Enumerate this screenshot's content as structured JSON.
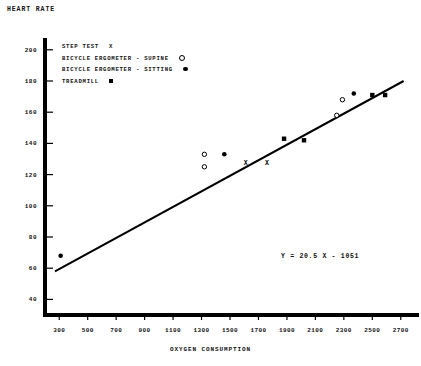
{
  "chart_data": {
    "type": "scatter",
    "title": "HEART RATE",
    "ylabel": "HEART RATE",
    "xlabel": "OXYGEN CONSUMPTION",
    "xlim": [
      200,
      2800
    ],
    "ylim": [
      30,
      205
    ],
    "xticks": [
      300,
      500,
      700,
      900,
      1100,
      1300,
      1500,
      1700,
      1900,
      2100,
      2300,
      2500,
      2700
    ],
    "yticks": [
      40,
      60,
      80,
      100,
      120,
      140,
      160,
      180,
      200
    ],
    "grid": false,
    "legend_position": "upper-left",
    "annotation": "Y = 20.5 X - 1051",
    "regression_line": {
      "label": "Y = 20.5 X - 1051",
      "x_start": 270,
      "y_start": 58,
      "x_end": 2720,
      "y_end": 180
    },
    "series": [
      {
        "name": "STEP TEST",
        "marker": "x",
        "points": [
          {
            "x": 1610,
            "y": 128
          },
          {
            "x": 1760,
            "y": 128
          }
        ]
      },
      {
        "name": "BICYCLE ERGOMETER - SUPINE",
        "marker": "open-circle",
        "points": [
          {
            "x": 1320,
            "y": 133
          },
          {
            "x": 1320,
            "y": 125
          },
          {
            "x": 2290,
            "y": 168
          },
          {
            "x": 2250,
            "y": 158
          }
        ]
      },
      {
        "name": "BICYCLE ERGOMETER - SITTING",
        "marker": "filled-circle",
        "points": [
          {
            "x": 310,
            "y": 68
          },
          {
            "x": 1460,
            "y": 133
          },
          {
            "x": 2370,
            "y": 172
          }
        ]
      },
      {
        "name": "TREADMILL",
        "marker": "filled-square",
        "points": [
          {
            "x": 1880,
            "y": 143
          },
          {
            "x": 2020,
            "y": 142
          },
          {
            "x": 2500,
            "y": 171
          },
          {
            "x": 2590,
            "y": 171
          }
        ]
      }
    ]
  },
  "legend": {
    "items": [
      {
        "label": "STEP TEST",
        "marker": "x-marker"
      },
      {
        "label": "BICYCLE ERGOMETER - SUPINE",
        "marker": "open-circle-marker"
      },
      {
        "label": "BICYCLE ERGOMETER - SITTING",
        "marker": "filled-circle-marker"
      },
      {
        "label": "TREADMILL",
        "marker": "filled-square-marker"
      }
    ]
  },
  "colors": {
    "ink": "#000000",
    "background": "#ffffff"
  }
}
